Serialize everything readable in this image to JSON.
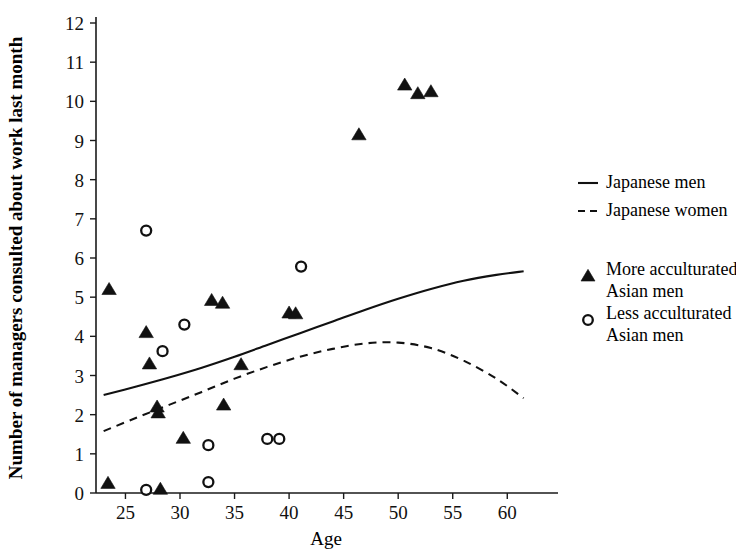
{
  "chart_data": {
    "type": "scatter",
    "title": "",
    "xlabel": "Age",
    "ylabel": "Number of managers consulted about work last month",
    "xlim": [
      22.3,
      63.0
    ],
    "ylim": [
      0,
      12
    ],
    "xticks": [
      25,
      30,
      35,
      40,
      45,
      50,
      55,
      60
    ],
    "yticks": [
      0,
      1,
      2,
      3,
      4,
      5,
      6,
      7,
      8,
      9,
      10,
      11,
      12
    ],
    "grid": false,
    "legend_position": "right",
    "series": [
      {
        "name": "Japanese men",
        "type": "line",
        "style": "solid",
        "points": [
          [
            23.0,
            2.5
          ],
          [
            26.0,
            2.72
          ],
          [
            29.0,
            2.95
          ],
          [
            32.0,
            3.2
          ],
          [
            35.0,
            3.48
          ],
          [
            38.0,
            3.78
          ],
          [
            41.0,
            4.08
          ],
          [
            44.0,
            4.38
          ],
          [
            47.0,
            4.68
          ],
          [
            50.0,
            4.96
          ],
          [
            53.0,
            5.21
          ],
          [
            56.0,
            5.42
          ],
          [
            59.0,
            5.57
          ],
          [
            61.5,
            5.66
          ]
        ]
      },
      {
        "name": "Japanese women",
        "type": "line",
        "style": "dashed",
        "points": [
          [
            23.0,
            1.58
          ],
          [
            26.0,
            1.92
          ],
          [
            29.0,
            2.25
          ],
          [
            32.0,
            2.58
          ],
          [
            35.0,
            2.92
          ],
          [
            38.0,
            3.22
          ],
          [
            41.0,
            3.48
          ],
          [
            44.0,
            3.68
          ],
          [
            47.0,
            3.82
          ],
          [
            50.0,
            3.84
          ],
          [
            53.0,
            3.7
          ],
          [
            56.0,
            3.38
          ],
          [
            59.0,
            2.92
          ],
          [
            61.5,
            2.42
          ]
        ]
      },
      {
        "name": "More acculturated Asian men",
        "type": "scatter",
        "marker": "filled-triangle",
        "points": [
          [
            23.4,
            0.25
          ],
          [
            23.5,
            5.2
          ],
          [
            26.9,
            4.1
          ],
          [
            27.2,
            3.3
          ],
          [
            27.9,
            2.2
          ],
          [
            28.0,
            2.05
          ],
          [
            28.2,
            0.1
          ],
          [
            30.3,
            1.4
          ],
          [
            32.9,
            4.92
          ],
          [
            33.9,
            4.85
          ],
          [
            34.0,
            2.25
          ],
          [
            35.6,
            3.28
          ],
          [
            40.0,
            4.6
          ],
          [
            40.6,
            4.58
          ],
          [
            46.4,
            9.15
          ],
          [
            50.6,
            10.42
          ],
          [
            51.8,
            10.2
          ],
          [
            53.0,
            10.25
          ]
        ]
      },
      {
        "name": "Less acculturated Asian men",
        "type": "scatter",
        "marker": "open-circle",
        "points": [
          [
            26.9,
            6.7
          ],
          [
            26.9,
            0.08
          ],
          [
            28.4,
            3.62
          ],
          [
            30.4,
            4.3
          ],
          [
            32.6,
            1.22
          ],
          [
            32.6,
            0.28
          ],
          [
            38.0,
            1.38
          ],
          [
            39.1,
            1.38
          ],
          [
            41.1,
            5.78
          ]
        ]
      }
    ]
  },
  "axes": {
    "x_title": "Age",
    "y_title": "Number of managers consulted about work last month",
    "x_tick_labels": [
      "25",
      "30",
      "35",
      "40",
      "45",
      "50",
      "55",
      "60"
    ],
    "y_tick_labels": [
      "0",
      "1",
      "2",
      "3",
      "4",
      "5",
      "6",
      "7",
      "8",
      "9",
      "10",
      "11",
      "12"
    ]
  },
  "legend": {
    "line_entries": [
      {
        "label": "Japanese men",
        "style": "solid"
      },
      {
        "label": "Japanese women",
        "style": "dashed"
      }
    ],
    "marker_entries": [
      {
        "label_line1": "More acculturated",
        "label_line2": "Asian men",
        "marker": "filled-triangle"
      },
      {
        "label_line1": "Less acculturated",
        "label_line2": "Asian men",
        "marker": "open-circle"
      }
    ]
  },
  "colors": {
    "ink": "#111111",
    "background": "#ffffff"
  }
}
